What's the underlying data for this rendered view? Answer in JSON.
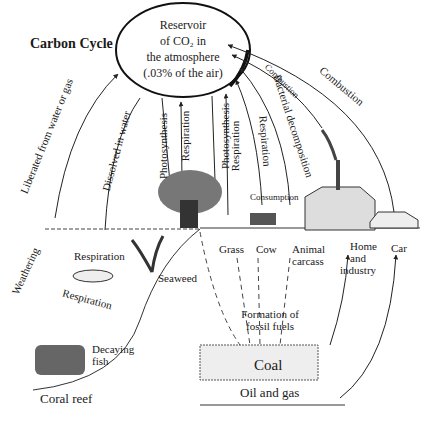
{
  "title": "Carbon Cycle",
  "reservoir": {
    "line1": "Reservoir",
    "line2": "of CO₂ in",
    "line3": "the atmosphere",
    "line4": "(.03% of the air)"
  },
  "arrows": {
    "liberated": "Liberated from water or gas",
    "dissolved": "Dissolved in water",
    "photosynthesis1": "Photosynthesis",
    "respiration1": "Respiration",
    "photosynthesis2": "Photosynthesis",
    "respiration2": "Respiration",
    "respiration3": "Respiration",
    "bacterial": "Bacterial decomposition",
    "combustion1": "Combustion",
    "combustion2": "Combustion",
    "consumption": "Consumption",
    "weathering": "Weathering",
    "respiration_sea1": "Respiration",
    "respiration_sea2": "Respiration"
  },
  "labels": {
    "grass": "Grass",
    "cow": "Cow",
    "animal_carcass_1": "Animal",
    "animal_carcass_2": "carcass",
    "home_1": "Home",
    "home_2": "and",
    "home_3": "industry",
    "car": "Car",
    "seaweed": "Seaweed",
    "decaying_1": "Decaying",
    "decaying_2": "fish",
    "coral_reef": "Coral reef",
    "fossil_1": "Formation of",
    "fossil_2": "fossil fuels",
    "coal": "Coal",
    "oil_gas": "Oil and gas"
  }
}
